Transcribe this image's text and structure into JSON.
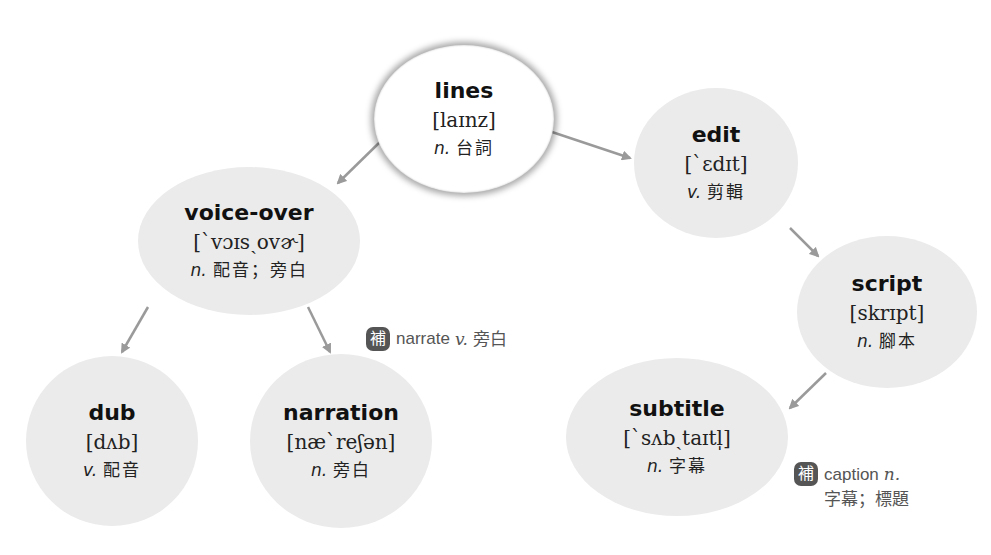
{
  "nodes": {
    "lines": {
      "word": "lines",
      "ipa": "[laɪnz]",
      "pos": "n.",
      "meaning": "台詞"
    },
    "voice_over": {
      "word": "voice-over",
      "ipa": "[ˋvɔɪsˏovɚ]",
      "pos": "n.",
      "meaning": "配音；旁白"
    },
    "edit": {
      "word": "edit",
      "ipa": "[ˋɛdɪt]",
      "pos": "v.",
      "meaning": "剪輯"
    },
    "script": {
      "word": "script",
      "ipa": "[skrɪpt]",
      "pos": "n.",
      "meaning": "腳本"
    },
    "dub": {
      "word": "dub",
      "ipa": "[dʌb]",
      "pos": "v.",
      "meaning": "配音"
    },
    "narration": {
      "word": "narration",
      "ipa": "[næˋreʃən]",
      "pos": "n.",
      "meaning": "旁白"
    },
    "subtitle": {
      "word": "subtitle",
      "ipa": "[ˋsʌbˏtaɪtl̩]",
      "pos": "n.",
      "meaning": "字幕"
    }
  },
  "notes": {
    "narrate": {
      "badge": "補",
      "word": "narrate",
      "pos": "v.",
      "meaning": "旁白"
    },
    "caption": {
      "badge": "補",
      "word": "caption",
      "pos": "n.",
      "meaning": "字幕；標題"
    }
  },
  "colors": {
    "node_fill": "#ebebeb",
    "root_fill": "#ffffff",
    "arrow": "#9a9a9a",
    "badge": "#555555"
  }
}
